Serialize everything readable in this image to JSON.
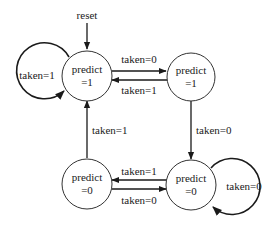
{
  "diagram": {
    "title": "",
    "initial": {
      "label": "reset"
    },
    "states": [
      {
        "id": "s0",
        "line1": "predict",
        "line2": "=1"
      },
      {
        "id": "s1",
        "line1": "predict",
        "line2": "=1"
      },
      {
        "id": "s2",
        "line1": "predict",
        "line2": "=0"
      },
      {
        "id": "s3",
        "line1": "predict",
        "line2": "=0"
      }
    ],
    "transitions": [
      {
        "from": "s0",
        "to": "s0",
        "label": "taken=1"
      },
      {
        "from": "s0",
        "to": "s1",
        "label": "taken=0"
      },
      {
        "from": "s1",
        "to": "s0",
        "label": "taken=1"
      },
      {
        "from": "s1",
        "to": "s3",
        "label": "taken=0"
      },
      {
        "from": "s2",
        "to": "s0",
        "label": "taken=1"
      },
      {
        "from": "s3",
        "to": "s2",
        "label": "taken=1"
      },
      {
        "from": "s2",
        "to": "s3",
        "label": "taken=0"
      },
      {
        "from": "s3",
        "to": "s3",
        "label": "taken=0"
      }
    ],
    "colors": {
      "stroke": "#1a1a1a",
      "background": "#ffffff"
    }
  }
}
